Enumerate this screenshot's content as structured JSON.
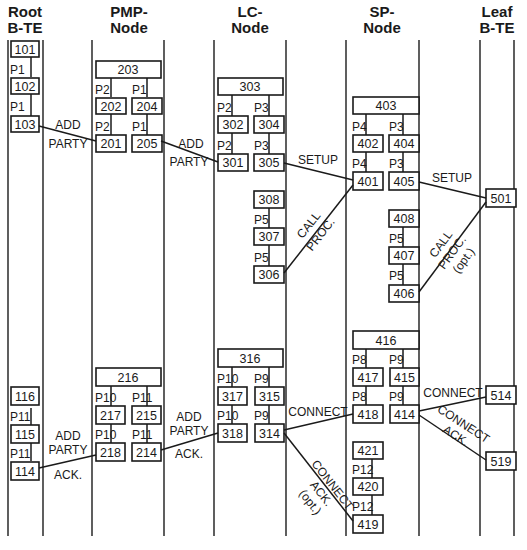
{
  "columns": [
    {
      "id": "root",
      "line1": "Root",
      "line2": "B-TE"
    },
    {
      "id": "pmp",
      "line1": "PMP-",
      "line2": "Node"
    },
    {
      "id": "lc",
      "line1": "LC-",
      "line2": "Node"
    },
    {
      "id": "sp",
      "line1": "SP-",
      "line2": "Node"
    },
    {
      "id": "leaf",
      "line1": "Leaf",
      "line2": "B-TE"
    }
  ],
  "boxes": {
    "b101": "101",
    "b102": "102",
    "b103": "103",
    "b203": "203",
    "b202": "202",
    "b204": "204",
    "b201": "201",
    "b205": "205",
    "b303": "303",
    "b302": "302",
    "b304": "304",
    "b301": "301",
    "b305": "305",
    "b308": "308",
    "b307": "307",
    "b306": "306",
    "b403": "403",
    "b402": "402",
    "b404": "404",
    "b401": "401",
    "b405": "405",
    "b408": "408",
    "b407": "407",
    "b406": "406",
    "b501": "501",
    "b116": "116",
    "b115": "115",
    "b114": "114",
    "b216": "216",
    "b217": "217",
    "b215": "215",
    "b218": "218",
    "b214": "214",
    "b316": "316",
    "b317": "317",
    "b315": "315",
    "b318": "318",
    "b314": "314",
    "b416": "416",
    "b417": "417",
    "b415": "415",
    "b418": "418",
    "b414": "414",
    "b421": "421",
    "b420": "420",
    "b419": "419",
    "b514": "514",
    "b519": "519"
  },
  "ports": {
    "p1": "P1",
    "p2": "P2",
    "p3": "P3",
    "p4": "P4",
    "p5": "P5",
    "p8": "P8",
    "p9": "P9",
    "p10": "P10",
    "p11": "P11",
    "p12": "P12"
  },
  "messages": {
    "add_party_1": {
      "l1": "ADD",
      "l2": "PARTY"
    },
    "add_party_2": {
      "l1": "ADD",
      "l2": "PARTY"
    },
    "setup_1": "SETUP",
    "setup_2": "SETUP",
    "call_proc_1": {
      "l1": "CALL",
      "l2": "PROC."
    },
    "call_proc_2": {
      "l1": "CALL",
      "l2": "PROC.",
      "l3": "(opt.)"
    },
    "add_party_ack_1": {
      "l1": "ADD",
      "l2": "PARTY",
      "l3": "ACK."
    },
    "add_party_ack_2": {
      "l1": "ADD",
      "l2": "PARTY",
      "l3": "ACK."
    },
    "connect_1": "CONNECT",
    "connect_2": "CONNECT",
    "connect_ack_1": {
      "l1": "CONNECT",
      "l2": "ACK.",
      "l3": "(opt.)"
    },
    "connect_ack_2": {
      "l1": "CONNECT",
      "l2": "ACK."
    }
  }
}
